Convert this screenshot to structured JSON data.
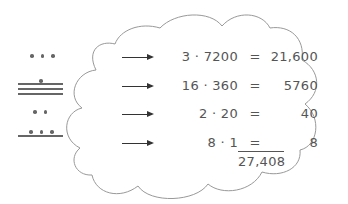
{
  "numerals": [
    {
      "position": "7200s",
      "dots": 3,
      "bars": 0
    },
    {
      "position": "360s",
      "dots": 1,
      "bars": 3
    },
    {
      "position": "20s",
      "dots": 2,
      "bars": 0
    },
    {
      "position": "1s",
      "dots": 3,
      "bars": 1
    }
  ],
  "calculations": [
    {
      "lhs": "3 · 7200",
      "eq": "=",
      "rhs": "21,600"
    },
    {
      "lhs": "16 · 360",
      "eq": "=",
      "rhs": "5760"
    },
    {
      "lhs": "2 · 20",
      "eq": "=",
      "rhs": "40"
    },
    {
      "lhs": "8 · 1",
      "eq": "=",
      "rhs": "8"
    }
  ],
  "total": "27,408",
  "colors": {
    "line": "#999999",
    "text": "#555555",
    "arrow": "#333333"
  }
}
